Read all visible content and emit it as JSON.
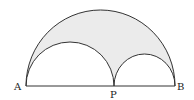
{
  "diagram": {
    "points": {
      "A": {
        "label": "A",
        "x": 26,
        "y": 86
      },
      "P": {
        "label": "P",
        "x": 114,
        "y": 86
      },
      "B": {
        "label": "B",
        "x": 175,
        "y": 86
      }
    },
    "arcs": [
      {
        "name": "large-semicircle",
        "from": "A",
        "to": "B"
      },
      {
        "name": "small-semicircle-AP",
        "from": "A",
        "to": "P"
      },
      {
        "name": "small-semicircle-PB",
        "from": "P",
        "to": "B"
      }
    ],
    "colors": {
      "shaded_region": "#ebebeb",
      "stroke": "#333333"
    }
  }
}
